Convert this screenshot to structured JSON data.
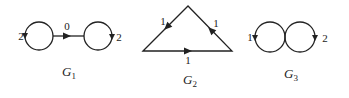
{
  "diagram": {
    "stroke_color": "#222222",
    "graphs": [
      {
        "id": "G1",
        "label": "G",
        "subscript": "1",
        "nodes": [
          {
            "name": "left-loop",
            "type": "self-loop",
            "weight": "2"
          },
          {
            "name": "right-loop",
            "type": "self-loop",
            "weight": "2"
          }
        ],
        "edges": [
          {
            "from": "left-loop",
            "to": "right-loop",
            "weight": "0"
          }
        ],
        "loop_labels": [
          "2",
          "2"
        ],
        "edge_label": "0"
      },
      {
        "id": "G2",
        "label": "G",
        "subscript": "2",
        "shape": "triangle",
        "edges": [
          {
            "side": "left",
            "weight": "1"
          },
          {
            "side": "right",
            "weight": "1"
          },
          {
            "side": "bottom",
            "weight": "1"
          }
        ],
        "edge_labels": [
          "1",
          "1",
          "1"
        ]
      },
      {
        "id": "G3",
        "label": "G",
        "subscript": "3",
        "shape": "two-touching-loops",
        "loops": [
          {
            "side": "left",
            "weight": "1"
          },
          {
            "side": "right",
            "weight": "2"
          }
        ],
        "loop_labels": [
          "1",
          "2"
        ]
      }
    ]
  }
}
